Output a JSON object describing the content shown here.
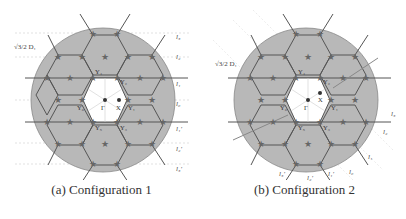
{
  "figures": [
    {
      "id": "a",
      "caption": "(a) Configuration 1",
      "scale_label": "√3/2 D₁",
      "line_labels": [
        "l₃",
        "l₂",
        "l₁",
        "l₀",
        "l₁'",
        "l₂'",
        "l₃'"
      ],
      "points": [
        "Y₄",
        "Y₂",
        "Y₆",
        "Γ",
        "X",
        "Y₁",
        "Y₅",
        "Y₃"
      ]
    },
    {
      "id": "b",
      "caption": "(b) Configuration 2",
      "scale_label": "√3/2 D₁",
      "line_labels": [
        "l₃",
        "l₂",
        "l₁",
        "l₀",
        "l₁'",
        "l₂'",
        "l₃'"
      ],
      "points": [
        "Y₄",
        "Y₂",
        "Y₆",
        "Γ",
        "X",
        "Y₁",
        "Y₅",
        "Y₃"
      ]
    }
  ],
  "colors": {
    "disk_fill": "#b8b8b8",
    "hex_stroke": "#555555",
    "star_fill": "#666666",
    "center_fill": "#ffffff"
  }
}
